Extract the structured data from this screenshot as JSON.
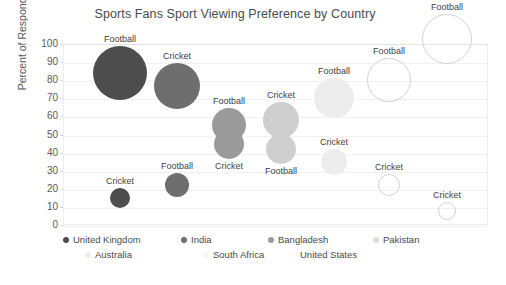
{
  "chart_data": {
    "type": "scatter",
    "title": "Sports Fans Sport Viewing Preference by Country",
    "xlabel": "",
    "ylabel": "Percent of Respondents",
    "ylim": [
      0,
      100
    ],
    "ytick_labels": [
      "100",
      "90",
      "80",
      "70",
      "60",
      "50",
      "40",
      "30",
      "20",
      "10",
      "0"
    ],
    "ytick_values": [
      100,
      90,
      80,
      70,
      60,
      50,
      40,
      30,
      20,
      10,
      0
    ],
    "grid": true,
    "legend_position": "bottom",
    "categories": [
      "Football",
      "Cricket"
    ],
    "series": [
      {
        "name": "United Kingdom",
        "color": "#4d4d4d",
        "fill": true,
        "points": [
          {
            "label": "Football",
            "value": 84,
            "x_pos": 120,
            "radius": 27
          },
          {
            "label": "Cricket",
            "value": 15,
            "x_pos": 120,
            "radius": 10
          }
        ]
      },
      {
        "name": "India",
        "color": "#6e6e6e",
        "fill": true,
        "points": [
          {
            "label": "Cricket",
            "value": 77,
            "x_pos": 177,
            "radius": 23
          },
          {
            "label": "Football",
            "value": 22,
            "x_pos": 177,
            "radius": 12
          }
        ]
      },
      {
        "name": "Bangladesh",
        "color": "#9a9a9a",
        "fill": true,
        "points": [
          {
            "label": "Football",
            "value": 55,
            "x_pos": 229,
            "radius": 17
          },
          {
            "label": "Cricket",
            "value": 45,
            "x_pos": 229,
            "radius": 15
          }
        ]
      },
      {
        "name": "Pakistan",
        "color": "#cfcfcf",
        "fill": true,
        "points": [
          {
            "label": "Cricket",
            "value": 58,
            "x_pos": 281,
            "radius": 18
          },
          {
            "label": "Football",
            "value": 42,
            "x_pos": 281,
            "radius": 15
          }
        ]
      },
      {
        "name": "Australia",
        "color": "#ededed",
        "fill": true,
        "points": [
          {
            "label": "Football",
            "value": 70,
            "x_pos": 334,
            "radius": 20
          },
          {
            "label": "Cricket",
            "value": 35,
            "x_pos": 334,
            "radius": 13
          }
        ]
      },
      {
        "name": "South Africa",
        "color": "#fbfbfb",
        "fill": false,
        "points": [
          {
            "label": "Football",
            "value": 80,
            "x_pos": 389,
            "radius": 22
          },
          {
            "label": "Cricket",
            "value": 22,
            "x_pos": 389,
            "radius": 11
          }
        ]
      },
      {
        "name": "United States",
        "color": "#fdfdfd",
        "fill": false,
        "points": [
          {
            "label": "Football",
            "value": 103,
            "x_pos": 447,
            "radius": 25
          },
          {
            "label": "Cricket",
            "value": 8,
            "x_pos": 447,
            "radius": 9
          }
        ]
      }
    ]
  },
  "legend": {
    "row1": [
      {
        "name": "United Kingdom",
        "color": "#4d4d4d"
      },
      {
        "name": "India",
        "color": "#6e6e6e"
      },
      {
        "name": "Bangladesh",
        "color": "#9a9a9a"
      },
      {
        "name": "Pakistan",
        "color": "#dcdcdc"
      }
    ],
    "row2": [
      {
        "name": "Australia",
        "color": "#ededed"
      },
      {
        "name": "South Africa",
        "color": "#f6f6f6"
      },
      {
        "name": "United States",
        "color": "#fbfbfb"
      }
    ]
  }
}
